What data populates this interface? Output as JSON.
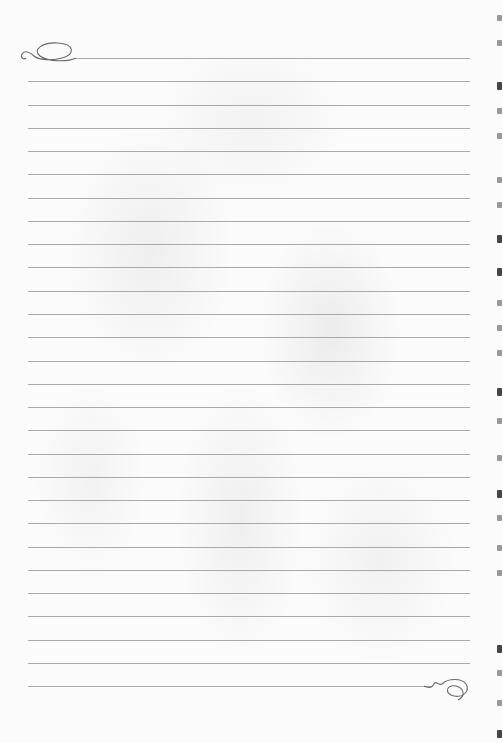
{
  "page": {
    "type": "lined-stationery",
    "background": "faint floral watermark",
    "line_color": "#a9a9a9",
    "line_count": 28,
    "first_line_y": 58,
    "line_spacing": 23.27,
    "line_left": 28,
    "line_right": 470,
    "top_flourish": "swirl-left",
    "bottom_flourish": "swirl-right"
  },
  "edge_fragments": [
    {
      "y": 15,
      "dark": false
    },
    {
      "y": 40,
      "dark": false
    },
    {
      "y": 82,
      "dark": true
    },
    {
      "y": 108,
      "dark": false
    },
    {
      "y": 133,
      "dark": false
    },
    {
      "y": 177,
      "dark": false
    },
    {
      "y": 202,
      "dark": false
    },
    {
      "y": 235,
      "dark": true
    },
    {
      "y": 268,
      "dark": true
    },
    {
      "y": 300,
      "dark": false
    },
    {
      "y": 325,
      "dark": false
    },
    {
      "y": 350,
      "dark": false
    },
    {
      "y": 388,
      "dark": true
    },
    {
      "y": 418,
      "dark": false
    },
    {
      "y": 455,
      "dark": false
    },
    {
      "y": 490,
      "dark": true
    },
    {
      "y": 515,
      "dark": false
    },
    {
      "y": 545,
      "dark": false
    },
    {
      "y": 570,
      "dark": false
    },
    {
      "y": 645,
      "dark": true
    },
    {
      "y": 670,
      "dark": false
    },
    {
      "y": 700,
      "dark": false
    },
    {
      "y": 730,
      "dark": true
    }
  ]
}
